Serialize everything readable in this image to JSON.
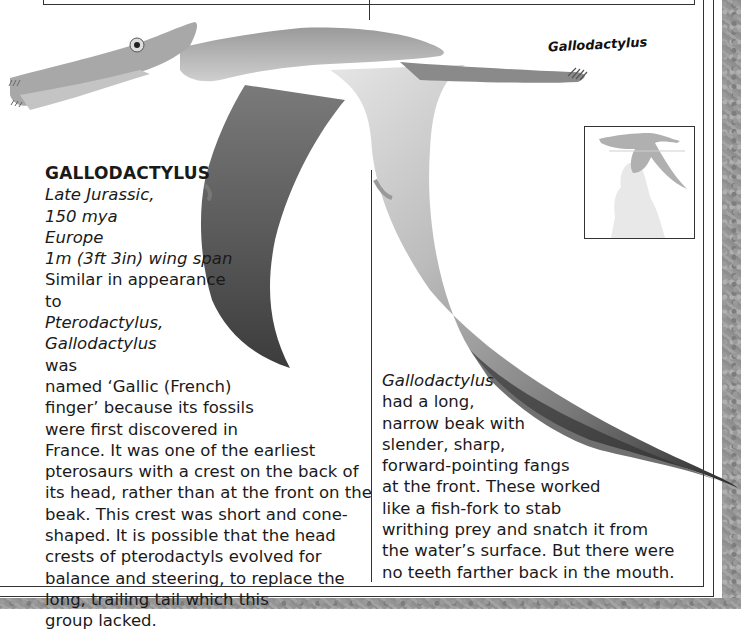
{
  "illustration": {
    "label": "Gallodactylus",
    "description": "Pterosaur in flight, long narrow beak with forward-pointing teeth, grey wing membranes"
  },
  "scale_inset": {
    "description": "Size comparison silhouette: pterosaur above a human figure"
  },
  "fact_file": {
    "name": "GALLODACTYLUS",
    "period": "Late Jurassic,",
    "age": "150 mya",
    "location": "Europe",
    "size": "1m (3ft 3in) wing span",
    "lines": [
      {
        "pre": "Similar in appearance",
        "it": "",
        "post": ""
      },
      {
        "pre": "to ",
        "it": "Pterodactylus,",
        "post": ""
      },
      {
        "pre": "",
        "it": "Gallodactylus",
        "post": " was"
      },
      {
        "pre": "named ‘Gallic (French)",
        "it": "",
        "post": ""
      },
      {
        "pre": "finger’ because its fossils",
        "it": "",
        "post": ""
      },
      {
        "pre": "were first discovered in",
        "it": "",
        "post": ""
      },
      {
        "pre": "France. It was one of the earliest",
        "it": "",
        "post": ""
      },
      {
        "pre": "pterosaurs with a crest on the back of",
        "it": "",
        "post": ""
      },
      {
        "pre": "its head, rather than at the front on the",
        "it": "",
        "post": ""
      },
      {
        "pre": "beak. This crest was short and cone-",
        "it": "",
        "post": ""
      },
      {
        "pre": "shaped. It is possible that the head",
        "it": "",
        "post": ""
      },
      {
        "pre": "crests of pterodactyls evolved for",
        "it": "",
        "post": ""
      },
      {
        "pre": "balance and steering, to replace the",
        "it": "",
        "post": ""
      },
      {
        "pre": "long, trailing tail which this",
        "it": "",
        "post": ""
      },
      {
        "pre": "group lacked.",
        "it": "",
        "post": ""
      }
    ]
  },
  "second_column": {
    "lines": [
      {
        "pre": "",
        "it": "Gallodactylus",
        "post": ""
      },
      {
        "pre": "had a long,",
        "it": "",
        "post": ""
      },
      {
        "pre": "narrow beak with",
        "it": "",
        "post": ""
      },
      {
        "pre": "slender, sharp,",
        "it": "",
        "post": ""
      },
      {
        "pre": "forward-pointing fangs",
        "it": "",
        "post": ""
      },
      {
        "pre": "at the front. These worked",
        "it": "",
        "post": ""
      },
      {
        "pre": "like a fish-fork to stab",
        "it": "",
        "post": ""
      },
      {
        "pre": "writhing prey and snatch it from",
        "it": "",
        "post": ""
      },
      {
        "pre": "the water’s surface. But there were",
        "it": "",
        "post": ""
      },
      {
        "pre": "no teeth farther back in the mouth.",
        "it": "",
        "post": ""
      }
    ]
  }
}
